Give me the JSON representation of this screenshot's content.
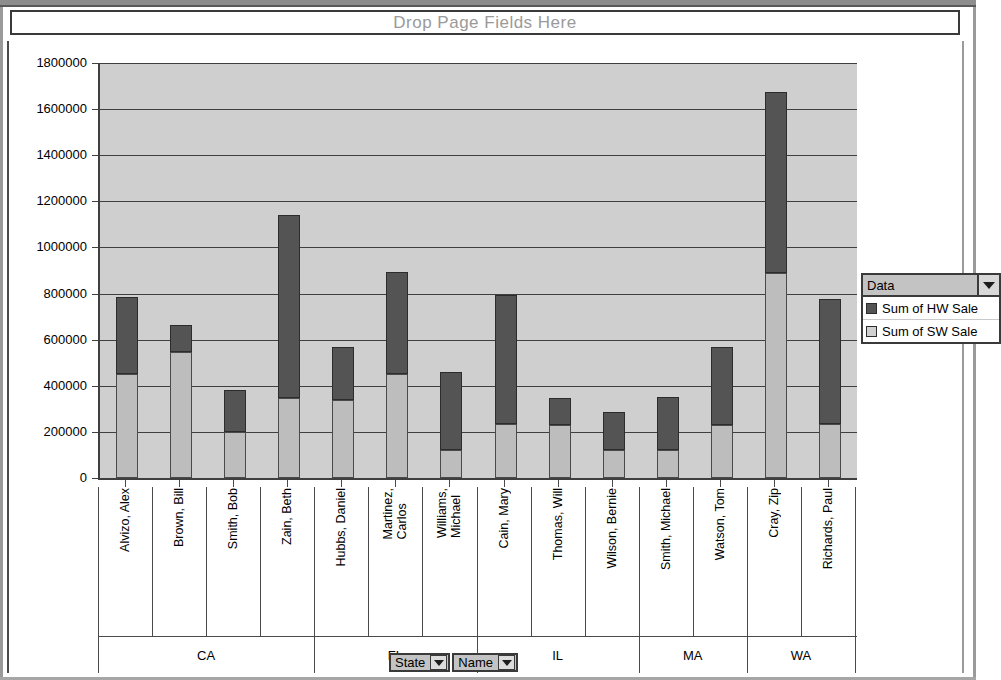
{
  "page_field_zone": {
    "label": "Drop Page Fields Here"
  },
  "legend": {
    "header_label": "Data",
    "dropdown_icon": "chevron-down-icon",
    "items": [
      {
        "label": "Sum of HW Sale",
        "color": "#545454",
        "swatch": "hw"
      },
      {
        "label": "Sum of SW Sale",
        "color": "#d0d0d0",
        "swatch": "sw"
      }
    ]
  },
  "field_buttons": [
    {
      "label": "State",
      "icon": "chevron-down-icon"
    },
    {
      "label": "Name",
      "icon": "chevron-down-icon"
    }
  ],
  "chart_data": {
    "type": "bar",
    "subtype": "stacked",
    "title": "",
    "xlabel": "",
    "ylabel": "",
    "ylim": [
      0,
      1800000
    ],
    "ytick_step": 200000,
    "ytick_labels": [
      "0",
      "200000",
      "400000",
      "600000",
      "800000",
      "1000000",
      "1200000",
      "1400000",
      "1600000",
      "1800000"
    ],
    "grid": true,
    "legend_position": "right",
    "group_field": "State",
    "category_field": "Name",
    "groups": [
      {
        "state": "CA",
        "count": 4
      },
      {
        "state": "FL",
        "count": 3
      },
      {
        "state": "IL",
        "count": 3
      },
      {
        "state": "MA",
        "count": 2
      },
      {
        "state": "WA",
        "count": 2
      }
    ],
    "categories": [
      "Alvizo, Alex",
      "Brown, Bill",
      "Smith, Bob",
      "Zain, Beth",
      "Hubbs, Daniel",
      "Martinez,\nCarlos",
      "Williams,\nMichael",
      "Cain, Mary",
      "Thomas, Will",
      "Wilson, Bernie",
      "Smith, Michael",
      "Watson, Tom",
      "Cray, Zip",
      "Richards, Paul"
    ],
    "series": [
      {
        "name": "Sum of SW Sale",
        "color": "#bdbdbd",
        "values": [
          450000,
          545000,
          200000,
          345000,
          340000,
          450000,
          120000,
          235000,
          230000,
          120000,
          120000,
          230000,
          890000,
          235000
        ]
      },
      {
        "name": "Sum of HW Sale",
        "color": "#545454",
        "values": [
          335000,
          120000,
          180000,
          795000,
          230000,
          445000,
          340000,
          560000,
          115000,
          165000,
          230000,
          340000,
          785000,
          540000
        ]
      }
    ],
    "totals": [
      785000,
      665000,
      380000,
      1140000,
      570000,
      895000,
      460000,
      795000,
      345000,
      285000,
      350000,
      570000,
      1675000,
      775000
    ]
  }
}
